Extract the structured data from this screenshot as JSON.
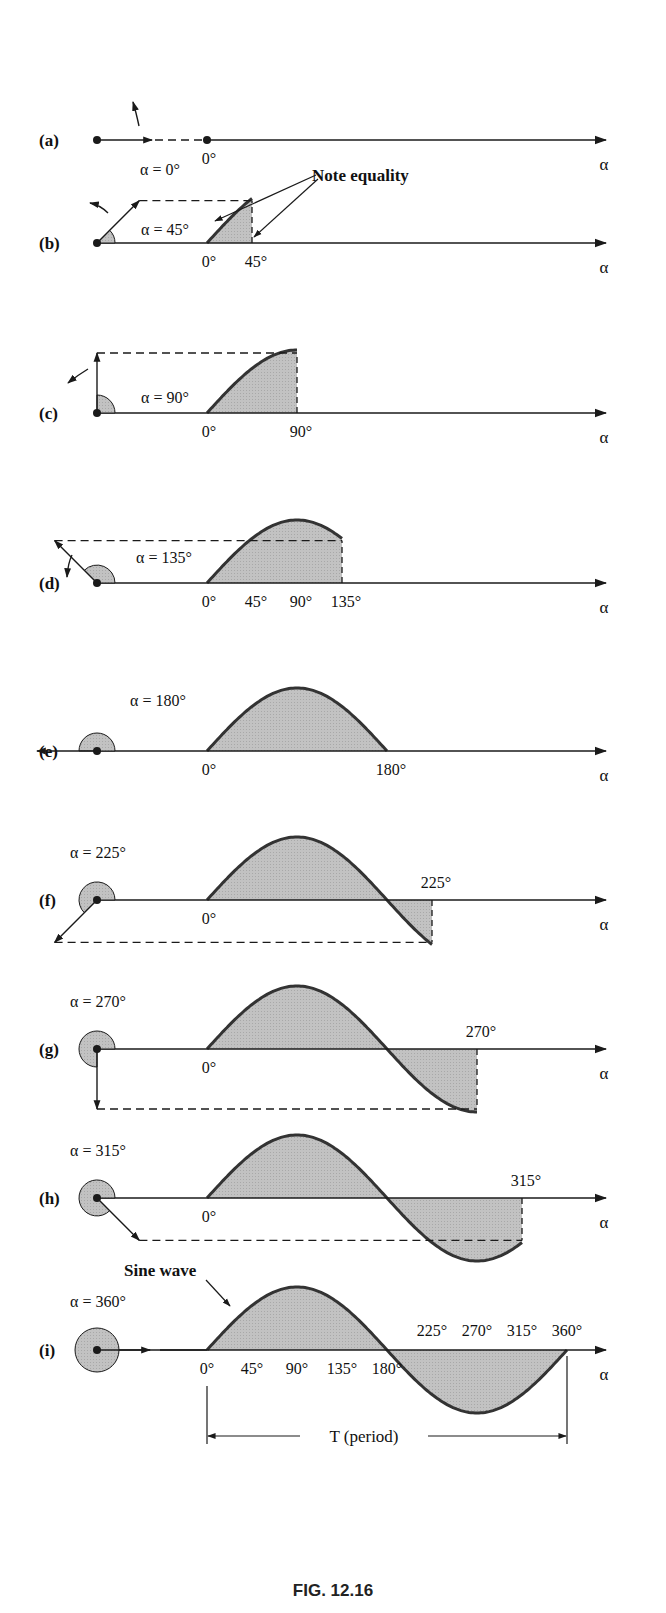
{
  "figure": {
    "caption": "FIG. 12.16",
    "axis_symbol": "α",
    "colors": {
      "stroke": "#1a1a1a",
      "curve": "#333333",
      "fill": "#bdbdbd",
      "background": "#ffffff"
    },
    "panels": [
      {
        "id": "a",
        "label": "(a)",
        "angle": 0,
        "angle_label": "α = 0°",
        "ticks": [
          "0°"
        ]
      },
      {
        "id": "b",
        "label": "(b)",
        "angle": 45,
        "angle_label": "α = 45°",
        "ticks": [
          "0°",
          "45°"
        ],
        "annotation": "Note equality"
      },
      {
        "id": "c",
        "label": "(c)",
        "angle": 90,
        "angle_label": "α = 90°",
        "ticks": [
          "0°",
          "90°"
        ]
      },
      {
        "id": "d",
        "label": "(d)",
        "angle": 135,
        "angle_label": "α = 135°",
        "ticks": [
          "0°",
          "45°",
          "90°",
          "135°"
        ]
      },
      {
        "id": "e",
        "label": "(e)",
        "angle": 180,
        "angle_label": "α = 180°",
        "ticks": [
          "0°",
          "180°"
        ]
      },
      {
        "id": "f",
        "label": "(f)",
        "angle": 225,
        "angle_label": "α = 225°",
        "ticks": [
          "0°",
          "225°"
        ]
      },
      {
        "id": "g",
        "label": "(g)",
        "angle": 270,
        "angle_label": "α = 270°",
        "ticks": [
          "0°",
          "270°"
        ]
      },
      {
        "id": "h",
        "label": "(h)",
        "angle": 315,
        "angle_label": "α = 315°",
        "ticks": [
          "0°",
          "315°"
        ]
      },
      {
        "id": "i",
        "label": "(i)",
        "angle": 360,
        "angle_label": "α = 360°",
        "ticks": [
          "0°",
          "45°",
          "90°",
          "135°",
          "180°",
          "225°",
          "270°",
          "315°",
          "360°"
        ],
        "annotation": "Sine wave",
        "period_label": "T (period)"
      }
    ]
  }
}
